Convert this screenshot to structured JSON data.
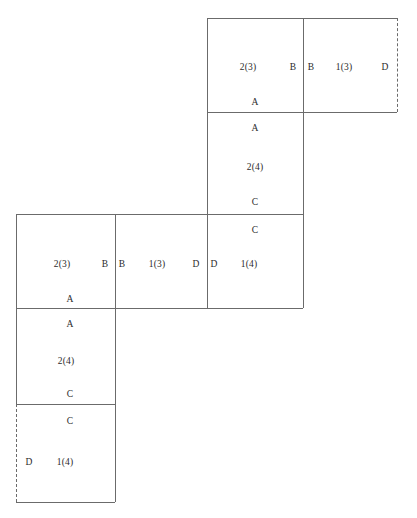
{
  "diagram": {
    "stroke_color": "#6b6b6b",
    "text_color": "#2b2b2b",
    "background": "#ffffff",
    "cells": [
      {
        "id": "top-left-square",
        "x": 207,
        "y": 18,
        "w": 96,
        "h": 94,
        "edges": {
          "top": "solid",
          "right": "solid",
          "bottom": "solid",
          "left": "solid"
        },
        "labels": [
          {
            "name": "cell-number",
            "text": "2(3)",
            "x": 248,
            "y": 68
          },
          {
            "name": "edge-label-right",
            "text": "B",
            "x": 293,
            "y": 68
          },
          {
            "name": "edge-label-bottom",
            "text": "A",
            "x": 255,
            "y": 103
          }
        ]
      },
      {
        "id": "top-right-square",
        "x": 303,
        "y": 18,
        "w": 94,
        "h": 94,
        "edges": {
          "top": "solid",
          "right": "dashed",
          "bottom": "solid",
          "left": "solid"
        },
        "labels": [
          {
            "name": "edge-label-left",
            "text": "B",
            "x": 311,
            "y": 68
          },
          {
            "name": "cell-number",
            "text": "1(3)",
            "x": 344,
            "y": 68
          },
          {
            "name": "edge-label-right",
            "text": "D",
            "x": 385,
            "y": 68
          }
        ]
      },
      {
        "id": "upper-middle-square",
        "x": 207,
        "y": 112,
        "w": 96,
        "h": 102,
        "edges": {
          "top": "solid",
          "right": "solid",
          "bottom": "solid",
          "left": "solid"
        },
        "labels": [
          {
            "name": "edge-label-top",
            "text": "A",
            "x": 255,
            "y": 129
          },
          {
            "name": "cell-number",
            "text": "2(4)",
            "x": 255,
            "y": 168
          },
          {
            "name": "edge-label-bottom",
            "text": "C",
            "x": 255,
            "y": 203
          }
        ]
      },
      {
        "id": "middle-left-square",
        "x": 16,
        "y": 214,
        "w": 99,
        "h": 94,
        "edges": {
          "top": "solid",
          "right": "solid",
          "bottom": "solid",
          "left": "solid"
        },
        "labels": [
          {
            "name": "cell-number",
            "text": "2(3)",
            "x": 62,
            "y": 265
          },
          {
            "name": "edge-label-right",
            "text": "B",
            "x": 105,
            "y": 265
          },
          {
            "name": "edge-label-bottom",
            "text": "A",
            "x": 70,
            "y": 300
          }
        ]
      },
      {
        "id": "middle-center-square",
        "x": 115,
        "y": 214,
        "w": 92,
        "h": 94,
        "edges": {
          "top": "solid",
          "right": "solid",
          "bottom": "solid",
          "left": "solid"
        },
        "labels": [
          {
            "name": "edge-label-left",
            "text": "B",
            "x": 122,
            "y": 265
          },
          {
            "name": "cell-number",
            "text": "1(3)",
            "x": 157,
            "y": 265
          },
          {
            "name": "edge-label-right",
            "text": "D",
            "x": 196,
            "y": 265
          }
        ]
      },
      {
        "id": "middle-right-square",
        "x": 207,
        "y": 214,
        "w": 96,
        "h": 94,
        "edges": {
          "top": "solid",
          "right": "solid",
          "bottom": "solid",
          "left": "solid"
        },
        "labels": [
          {
            "name": "edge-label-top",
            "text": "C",
            "x": 255,
            "y": 231
          },
          {
            "name": "edge-label-left",
            "text": "D",
            "x": 214,
            "y": 265
          },
          {
            "name": "cell-number",
            "text": "1(4)",
            "x": 249,
            "y": 265
          }
        ]
      },
      {
        "id": "lower-left-square",
        "x": 16,
        "y": 308,
        "w": 99,
        "h": 96,
        "edges": {
          "top": "solid",
          "right": "solid",
          "bottom": "solid",
          "left": "solid"
        },
        "labels": [
          {
            "name": "edge-label-top",
            "text": "A",
            "x": 70,
            "y": 325
          },
          {
            "name": "cell-number",
            "text": "2(4)",
            "x": 66,
            "y": 362
          },
          {
            "name": "edge-label-bottom",
            "text": "C",
            "x": 70,
            "y": 395
          }
        ]
      },
      {
        "id": "bottom-left-square",
        "x": 16,
        "y": 404,
        "w": 99,
        "h": 98,
        "edges": {
          "top": "solid",
          "right": "solid",
          "bottom": "solid",
          "left": "dashed"
        },
        "labels": [
          {
            "name": "edge-label-top",
            "text": "C",
            "x": 70,
            "y": 422
          },
          {
            "name": "edge-label-left",
            "text": "D",
            "x": 29,
            "y": 463
          },
          {
            "name": "cell-number",
            "text": "1(4)",
            "x": 65,
            "y": 463
          }
        ]
      }
    ]
  }
}
